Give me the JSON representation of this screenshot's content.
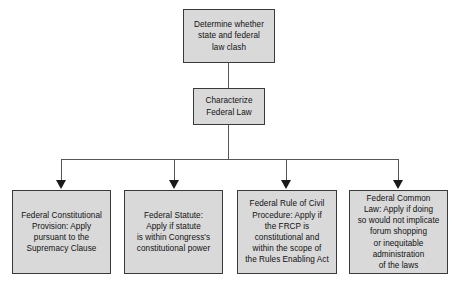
{
  "diagram": {
    "background_color": "#ffffff",
    "node_fill_color": "#d9d9d9",
    "node_border_color": "#3a3a3a",
    "connector_color": "#555555",
    "arrow_color": "#1a1a1a"
  },
  "nodes": {
    "root": {
      "label": "Determine whether\nstate and federal\nlaw clash"
    },
    "characterize": {
      "label": "Characterize\nFederal Law"
    }
  },
  "branches": [
    {
      "id": "constitutional-provision",
      "label": "Federal Constitutional\nProvision: Apply\npursuant to the\nSupremacy Clause"
    },
    {
      "id": "federal-statute",
      "label": "Federal Statute:\nApply if statute\nis within Congress's\nconstitutional power"
    },
    {
      "id": "frcp",
      "label": "Federal Rule of Civil\nProcedure: Apply if\nthe FRCP is\nconstitutional and\nwithin the scope of\nthe Rules Enabling Act"
    },
    {
      "id": "federal-common-law",
      "label": "Federal Common\nLaw:  Apply if doing\nso would not implicate\nforum shopping\nor inequitable\nadministration\nof the laws"
    }
  ]
}
